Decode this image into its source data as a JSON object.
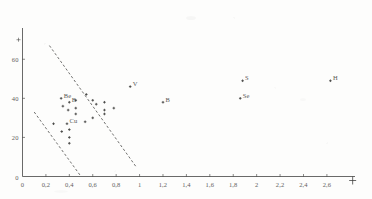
{
  "figure": {
    "kind": "scatter-plot",
    "ink_color": "#3a3a38",
    "paper_color": "#fdfdfc"
  },
  "chart_data": {
    "type": "scatter",
    "title": "",
    "xlabel": "",
    "ylabel": "",
    "xlim": [
      0,
      2.84
    ],
    "ylim": [
      0,
      76
    ],
    "grid": false,
    "legend": "none",
    "decimal_separator": ",",
    "x_ticks": [
      {
        "value": 0,
        "label": "0"
      },
      {
        "value": 0.2,
        "label": "0,2"
      },
      {
        "value": 0.4,
        "label": "0,4"
      },
      {
        "value": 0.6,
        "label": "0,6"
      },
      {
        "value": 0.8,
        "label": "0,8"
      },
      {
        "value": 1.0,
        "label": "1"
      },
      {
        "value": 1.2,
        "label": "1,2"
      },
      {
        "value": 1.4,
        "label": "1,4"
      },
      {
        "value": 1.6,
        "label": "1,6"
      },
      {
        "value": 1.8,
        "label": "1,8"
      },
      {
        "value": 2.0,
        "label": "2"
      },
      {
        "value": 2.2,
        "label": "2,2"
      },
      {
        "value": 2.4,
        "label": "2,4"
      },
      {
        "value": 2.6,
        "label": "2,6"
      }
    ],
    "y_ticks": [
      {
        "value": 0,
        "label": "0"
      },
      {
        "value": 20,
        "label": "20"
      },
      {
        "value": 40,
        "label": "40"
      },
      {
        "value": 60,
        "label": "60"
      }
    ],
    "axis_end_marker": {
      "x": 2.82,
      "y": 0,
      "glyph": "+"
    },
    "y_axis_top_mark": {
      "value": 70,
      "glyph": "+"
    },
    "points": [
      {
        "x": 0.33,
        "y": 40,
        "label": "Be"
      },
      {
        "x": 0.4,
        "y": 38,
        "label": "B"
      },
      {
        "x": 0.38,
        "y": 27,
        "label": "Cu"
      },
      {
        "x": 0.92,
        "y": 46,
        "label": "V"
      },
      {
        "x": 1.2,
        "y": 38,
        "label": "B"
      },
      {
        "x": 1.88,
        "y": 49,
        "label": "S"
      },
      {
        "x": 1.86,
        "y": 40,
        "label": "Se"
      },
      {
        "x": 2.63,
        "y": 49,
        "label": "H"
      },
      {
        "x": 0.345,
        "y": 36,
        "label": ""
      },
      {
        "x": 0.39,
        "y": 34,
        "label": ""
      },
      {
        "x": 0.455,
        "y": 39,
        "label": ""
      },
      {
        "x": 0.455,
        "y": 35,
        "label": ""
      },
      {
        "x": 0.455,
        "y": 32,
        "label": ""
      },
      {
        "x": 0.4,
        "y": 24,
        "label": ""
      },
      {
        "x": 0.4,
        "y": 20,
        "label": ""
      },
      {
        "x": 0.4,
        "y": 17,
        "label": ""
      },
      {
        "x": 0.545,
        "y": 42,
        "label": ""
      },
      {
        "x": 0.6,
        "y": 39,
        "label": ""
      },
      {
        "x": 0.6,
        "y": 30,
        "label": ""
      },
      {
        "x": 0.63,
        "y": 37,
        "label": ""
      },
      {
        "x": 0.7,
        "y": 38,
        "label": ""
      },
      {
        "x": 0.7,
        "y": 34,
        "label": ""
      },
      {
        "x": 0.7,
        "y": 32,
        "label": ""
      },
      {
        "x": 0.78,
        "y": 35,
        "label": ""
      },
      {
        "x": 0.535,
        "y": 28,
        "label": ""
      },
      {
        "x": 0.265,
        "y": 27,
        "label": ""
      },
      {
        "x": 0.335,
        "y": 23,
        "label": ""
      }
    ],
    "trend_lines": [
      {
        "name": "upper-dashed-line",
        "style": "dashed",
        "x1": 0.23,
        "y1": 67,
        "x2": 0.97,
        "y2": 5
      },
      {
        "name": "lower-dashed-line",
        "style": "dashed",
        "x1": 0.1,
        "y1": 33,
        "x2": 0.5,
        "y2": 0
      }
    ]
  }
}
